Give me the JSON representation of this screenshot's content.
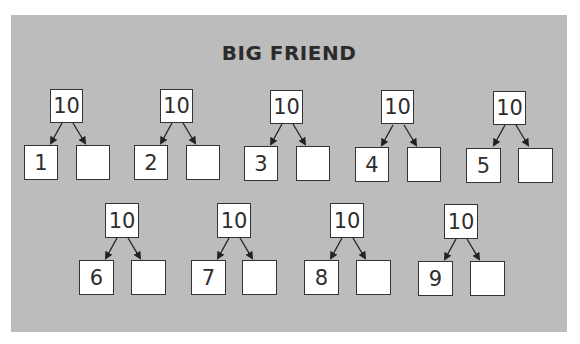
{
  "title": "BIG FRIEND",
  "trees": [
    {
      "top": "10",
      "left": "1",
      "right": ""
    },
    {
      "top": "10",
      "left": "2",
      "right": ""
    },
    {
      "top": "10",
      "left": "3",
      "right": ""
    },
    {
      "top": "10",
      "left": "4",
      "right": ""
    },
    {
      "top": "10",
      "left": "5",
      "right": ""
    },
    {
      "top": "10",
      "left": "6",
      "right": ""
    },
    {
      "top": "10",
      "left": "7",
      "right": ""
    },
    {
      "top": "10",
      "left": "8",
      "right": ""
    },
    {
      "top": "10",
      "left": "9",
      "right": ""
    }
  ],
  "colors": {
    "panel": "#bcbcbc",
    "box": "#ffffff",
    "ink": "#2b2b2b"
  }
}
